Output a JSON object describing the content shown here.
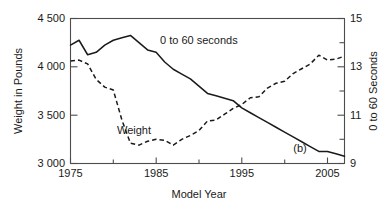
{
  "chart_data": {
    "type": "line",
    "title": "",
    "panel_label": "(b)",
    "xlabel": "Model Year",
    "ylabel_left": "Weight in Pounds",
    "ylabel_right": "0 to 60 Seconds",
    "xlim": [
      1975,
      2007
    ],
    "xticks": [
      1975,
      1985,
      1995,
      2005
    ],
    "xtick_labels": [
      "1975",
      "1985",
      "1995",
      "2005"
    ],
    "xminor_ticks": [
      1980,
      1990,
      2000
    ],
    "ylim_left": [
      3000,
      4500
    ],
    "yticks_left": [
      3000,
      3500,
      4000,
      4500
    ],
    "ytick_labels_left": [
      "3 000",
      "3 500",
      "4 000",
      "4 500"
    ],
    "ylim_right": [
      9,
      15
    ],
    "yticks_right": [
      9,
      11,
      13,
      15
    ],
    "ytick_labels_right": [
      "9",
      "11",
      "13",
      "15"
    ],
    "yminor_ticks_right": [
      10,
      12,
      14
    ],
    "grid": false,
    "legend_position": "inline-annotations",
    "series": [
      {
        "name": "0 to 60 seconds",
        "label": "0 to 60 seconds",
        "axis": "right",
        "style": "solid",
        "units": "seconds",
        "x": [
          1975,
          1976,
          1977,
          1978,
          1979,
          1980,
          1981,
          1982,
          1983,
          1984,
          1985,
          1986,
          1987,
          1988,
          1989,
          1990,
          1991,
          1992,
          1993,
          1994,
          1995,
          1996,
          1997,
          1998,
          1999,
          2000,
          2001,
          2002,
          2003,
          2004,
          2005,
          2006,
          2007
        ],
        "values": [
          13.9,
          14.1,
          13.5,
          13.6,
          13.9,
          14.1,
          14.2,
          14.3,
          14.0,
          13.7,
          13.6,
          13.2,
          12.9,
          12.7,
          12.5,
          12.2,
          11.9,
          11.8,
          11.7,
          11.6,
          11.3,
          11.1,
          10.9,
          10.7,
          10.5,
          10.3,
          10.1,
          9.9,
          9.7,
          9.5,
          9.5,
          9.4,
          9.3
        ]
      },
      {
        "name": "Weight",
        "label": "Weight",
        "axis": "left",
        "style": "dashed",
        "units": "pounds",
        "x": [
          1975,
          1976,
          1977,
          1978,
          1979,
          1980,
          1981,
          1982,
          1983,
          1984,
          1985,
          1986,
          1987,
          1988,
          1989,
          1990,
          1991,
          1992,
          1993,
          1994,
          1995,
          1996,
          1997,
          1998,
          1999,
          2000,
          2001,
          2002,
          2003,
          2004,
          2005,
          2006,
          2007
        ],
        "values": [
          4060,
          4070,
          4030,
          3870,
          3790,
          3760,
          3450,
          3210,
          3190,
          3230,
          3250,
          3240,
          3190,
          3250,
          3290,
          3340,
          3440,
          3450,
          3510,
          3570,
          3610,
          3680,
          3690,
          3780,
          3830,
          3850,
          3930,
          3980,
          4030,
          4120,
          4070,
          4080,
          4110
        ]
      }
    ],
    "annotations": [
      {
        "text": "0 to 60 seconds",
        "x": 1987,
        "y_right": 13.6
      },
      {
        "text": "Weight",
        "x": 1983.5,
        "y_left": 3430
      },
      {
        "text": "(b)",
        "x": 2002,
        "y_left": 3240
      }
    ]
  },
  "colors": {
    "line": "#1a1a1a",
    "axis": "#4d4d4d",
    "background": "#ffffff"
  }
}
